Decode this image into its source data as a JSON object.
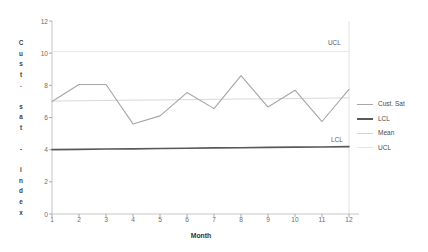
{
  "chart_data": {
    "type": "line",
    "title": "",
    "xlabel": "Month",
    "ylabel": "Cust. sat - index",
    "ylabel_stacked": "C\nu\ns\nt\n.\n \ns\na\nt\n \n-\n \ni\nn\nd\ne\nx",
    "x": [
      1,
      2,
      3,
      4,
      5,
      6,
      7,
      8,
      9,
      10,
      11,
      12
    ],
    "categories": [
      "1",
      "2",
      "3",
      "4",
      "5",
      "6",
      "7",
      "8",
      "9",
      "10",
      "11",
      "12"
    ],
    "xlim": [
      1,
      12
    ],
    "ylim": [
      0,
      12
    ],
    "yticks": [
      0,
      2,
      4,
      6,
      8,
      10,
      12
    ],
    "ytick_labels": [
      "0",
      "2",
      "4",
      "6",
      "8",
      "10",
      "12"
    ],
    "grid": false,
    "legend_position": "right",
    "series": [
      {
        "name": "Cust. Sat",
        "color": "#a6a6a6",
        "width": 1.1,
        "values": [
          7.0,
          8.05,
          8.05,
          5.6,
          6.1,
          7.55,
          6.55,
          8.6,
          6.65,
          7.7,
          5.75,
          7.75
        ]
      },
      {
        "name": "LCL",
        "color": "#595959",
        "width": 1.6,
        "values": [
          4.0,
          4.02,
          4.04,
          4.05,
          4.07,
          4.09,
          4.11,
          4.12,
          4.14,
          4.16,
          4.17,
          4.19
        ]
      },
      {
        "name": "Mean",
        "color": "#d9d9d9",
        "width": 1.0,
        "values": [
          7.02,
          7.04,
          7.06,
          7.08,
          7.09,
          7.11,
          7.13,
          7.15,
          7.16,
          7.18,
          7.2,
          7.22
        ]
      },
      {
        "name": "UCL",
        "color": "#e8e8e8",
        "width": 1.0,
        "values": [
          10.1,
          10.1,
          10.1,
          10.1,
          10.1,
          10.1,
          10.1,
          10.1,
          10.1,
          10.1,
          10.1,
          10.1
        ]
      }
    ],
    "annotations": [
      {
        "text": "UCL",
        "x": 11.2,
        "y": 10.6
      },
      {
        "text": "LCL",
        "x": 11.25,
        "y": 4.6
      }
    ],
    "legend": [
      {
        "label": "Cust. Sat",
        "color": "#a6a6a6",
        "width": 1.3
      },
      {
        "label": "LCL",
        "color": "#595959",
        "width": 2.0
      },
      {
        "label": "Mean",
        "color": "#d4d4d4",
        "width": 1.1
      },
      {
        "label": "UCL",
        "color": "#e2e2e2",
        "width": 1.1
      }
    ],
    "axis_color": "#b9b9b9",
    "tick_color": "#8a8a8a",
    "background": "#ffffff"
  }
}
